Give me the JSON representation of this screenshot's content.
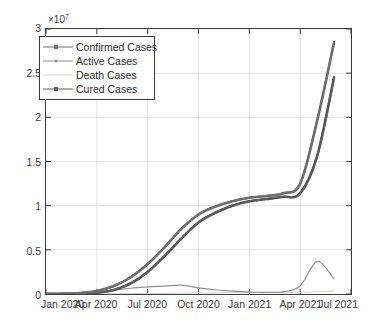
{
  "chart_data": {
    "type": "line",
    "title": "",
    "xlabel": "",
    "ylabel": "",
    "y_exponent_prefix": "×10",
    "y_exponent_power": "7",
    "y_axis_multiplier": 10000000,
    "ylim": [
      0,
      30000000
    ],
    "yticks": [
      0,
      5000000,
      10000000,
      15000000,
      20000000,
      25000000,
      30000000
    ],
    "ytick_labels": [
      "0",
      "0.5",
      "1",
      "1.5",
      "2",
      "2.5",
      "3"
    ],
    "xlim": [
      "2020-01-01",
      "2021-07-01"
    ],
    "xticks": [
      "2020-01",
      "2020-04",
      "2020-07",
      "2020-10",
      "2021-01",
      "2021-04",
      "2021-07"
    ],
    "xtick_labels": [
      "Jan 2020",
      "Apr 2020",
      "Jul 2020",
      "Oct 2020",
      "Jan 2021",
      "Apr 2021",
      "Jul 2021"
    ],
    "grid": true,
    "grid_color": "#e4e4e4",
    "axis_color": "#3a3a3a",
    "background": "#ffffff",
    "legend_position": "top-left",
    "x_months": [
      "2020-01",
      "2020-02",
      "2020-03",
      "2020-04",
      "2020-05",
      "2020-06",
      "2020-07",
      "2020-08",
      "2020-09",
      "2020-10",
      "2020-11",
      "2020-12",
      "2021-01",
      "2021-02",
      "2021-03",
      "2021-04",
      "2021-05",
      "2021-06"
    ],
    "series": [
      {
        "name": "Confirmed Cases",
        "color": "#6e6e6e",
        "line_width": 2.6,
        "marker": "square",
        "values": [
          10000,
          30000,
          120000,
          340000,
          900000,
          1900000,
          3400000,
          5300000,
          7400000,
          9000000,
          9900000,
          10500000,
          10900000,
          11100000,
          11400000,
          12500000,
          19600000,
          28500000
        ]
      },
      {
        "name": "Active Cases",
        "color": "#8f8f8f",
        "line_width": 1.2,
        "marker": "none",
        "values": [
          5000,
          20000,
          70000,
          180000,
          420000,
          650000,
          800000,
          900000,
          1000000,
          700000,
          480000,
          330000,
          230000,
          180000,
          250000,
          900000,
          3700000,
          1700000
        ]
      },
      {
        "name": "Death Cases",
        "color": "#d0d0d0",
        "line_width": 1.0,
        "marker": "none",
        "values": [
          200,
          900,
          3000,
          9000,
          22000,
          40000,
          60000,
          82000,
          106000,
          125000,
          138000,
          148000,
          155000,
          158000,
          162000,
          180000,
          250000,
          340000
        ]
      },
      {
        "name": "Cured Cases",
        "color": "#5a5a5a",
        "line_width": 2.6,
        "marker": "square",
        "values": [
          3000,
          9000,
          45000,
          150000,
          460000,
          1200000,
          2500000,
          4300000,
          6300000,
          8100000,
          9200000,
          10000000,
          10500000,
          10750000,
          11000000,
          11400000,
          15600000,
          24500000
        ]
      }
    ],
    "annotations": [
      {
        "label": "Active Cases first wave peak",
        "x": "2020-09",
        "y": 1000000
      },
      {
        "label": "Active Cases second wave peak",
        "x": "2021-05",
        "y": 3700000
      }
    ]
  },
  "legend": {
    "items": [
      {
        "label": "Confirmed Cases",
        "color": "#6e6e6e",
        "marker": "square",
        "line_width": 1.6
      },
      {
        "label": "Active Cases",
        "color": "#8f8f8f",
        "marker": "dot",
        "line_width": 1.2
      },
      {
        "label": "Death Cases",
        "color": "#d0d0d0",
        "marker": "none",
        "line_width": 1.0
      },
      {
        "label": "Cured Cases",
        "color": "#5a5a5a",
        "marker": "square",
        "line_width": 1.8
      }
    ]
  }
}
